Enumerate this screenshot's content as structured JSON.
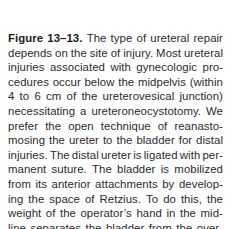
{
  "page": {
    "width": 232,
    "height": 229,
    "background_color": "#ffffff",
    "text_color": "#2b2b2b",
    "heading_color": "#1a1a1a"
  },
  "caption": {
    "label": "Figure 13–13.",
    "label_words": [
      "Figure",
      "13–13."
    ],
    "full_text": "Figure 13–13. The type of ureteral repair depends on the site of injury. Most ureteral injuries associated with gynecologic procedures occur below the midpelvis (within 4 to 6 cm of the ureterovesical junction) necessitating a ureteroneocystotomy. We prefer the open technique of reanastomosing the ureter to the bladder for distal injuries. The distal ureter is ligated with permanent suture. The bladder is mobilized from its anterior attachments by developing the space of Retzius. To do this, the weight of the operator's hand in the midline separates the bladder from the overlying symphysis.",
    "alignment": "justified",
    "lines": [
      {
        "index": 0,
        "last": false,
        "bold_count": 2,
        "words": [
          "Figure",
          "13–13.",
          "The",
          "type",
          "of",
          "ureteral",
          "repair"
        ]
      },
      {
        "index": 1,
        "last": false,
        "bold_count": 0,
        "words": [
          "depends",
          "on",
          "the",
          "site",
          "of",
          "injury.",
          "Most",
          "ureteral"
        ]
      },
      {
        "index": 2,
        "last": false,
        "bold_count": 0,
        "words": [
          "injuries",
          "associated",
          "with",
          "gynecologic",
          "pro-"
        ]
      },
      {
        "index": 3,
        "last": false,
        "bold_count": 0,
        "words": [
          "cedures",
          "occur",
          "below",
          "the",
          "midpelvis",
          "(within"
        ]
      },
      {
        "index": 4,
        "last": false,
        "bold_count": 0,
        "words": [
          "4",
          "to",
          "6",
          "cm",
          "of",
          "the",
          "ureterovesical",
          "junction)"
        ]
      },
      {
        "index": 5,
        "last": false,
        "bold_count": 0,
        "words": [
          "necessitating",
          "a",
          "ureteroneocystotomy.",
          "We"
        ]
      },
      {
        "index": 6,
        "last": false,
        "bold_count": 0,
        "words": [
          "prefer",
          "the",
          "open",
          "technique",
          "of",
          "reanasto-"
        ]
      },
      {
        "index": 7,
        "last": false,
        "bold_count": 0,
        "words": [
          "mosing",
          "the",
          "ureter",
          "to",
          "the",
          "bladder",
          "for",
          "distal"
        ]
      },
      {
        "index": 8,
        "last": false,
        "bold_count": 0,
        "words": [
          "injuries.",
          "The",
          "distal",
          "ureter",
          "is",
          "ligated",
          "with",
          "per-"
        ]
      },
      {
        "index": 9,
        "last": false,
        "bold_count": 0,
        "words": [
          "manent",
          "suture.",
          "The",
          "bladder",
          "is",
          "mobilized"
        ]
      },
      {
        "index": 10,
        "last": false,
        "bold_count": 0,
        "words": [
          "from",
          "its",
          "anterior",
          "attachments",
          "by",
          "develop-"
        ]
      },
      {
        "index": 11,
        "last": false,
        "bold_count": 0,
        "words": [
          "ing",
          "the",
          "space",
          "of",
          "Retzius.",
          "To",
          "do",
          "this,",
          "the"
        ]
      },
      {
        "index": 12,
        "last": false,
        "bold_count": 0,
        "words": [
          "weight",
          "of",
          "the",
          "operator’s",
          "hand",
          "in",
          "the",
          "mid-"
        ]
      },
      {
        "index": 13,
        "last": false,
        "bold_count": 0,
        "words": [
          "line",
          "separates",
          "the",
          "bladder",
          "from",
          "the",
          "over-"
        ]
      },
      {
        "index": 14,
        "last": true,
        "bold_count": 0,
        "words": [
          "lying",
          "symphysis."
        ]
      }
    ]
  }
}
